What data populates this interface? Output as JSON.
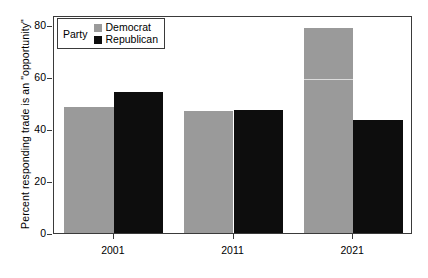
{
  "chart_data": {
    "type": "bar",
    "title": "",
    "xlabel": "",
    "ylabel": "Percent responding trade is an \"opportunity\"",
    "categories": [
      "2001",
      "2011",
      "2021"
    ],
    "series": [
      {
        "name": "Democrat",
        "color": "#9a9a9a",
        "values": [
          48.5,
          47.0,
          79.0
        ]
      },
      {
        "name": "Republican",
        "color": "#0d0d0d",
        "values": [
          54.5,
          47.5,
          43.5
        ]
      }
    ],
    "ylim": [
      0,
      84
    ],
    "yticks": [
      0,
      20,
      40,
      60,
      80
    ],
    "ytick_labels": [
      "0",
      "20",
      "40",
      "60",
      "80"
    ],
    "grid": false,
    "legend": {
      "position": "top-left",
      "title": "Party",
      "entries": [
        {
          "label": "Democrat",
          "color": "#9a9a9a"
        },
        {
          "label": "Republican",
          "color": "#0d0d0d"
        }
      ]
    }
  },
  "colors": {
    "democrat": "#9a9a9a",
    "republican": "#0d0d0d",
    "axis": "#3a3a3a",
    "background": "#ffffff"
  }
}
